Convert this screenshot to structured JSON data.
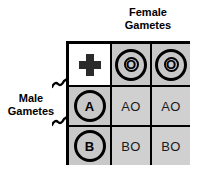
{
  "diagram": {
    "type": "punnett-square",
    "title_top": {
      "line1": "Female",
      "line2": "Gametes"
    },
    "title_left": {
      "line1": "Male",
      "line2": "Gametes"
    },
    "corner_icon": "cross-icon",
    "colors": {
      "grid_line": "#000000",
      "header_cell_fill": "#c8c8c8",
      "offspring_cell_fill": "#d0d0d0",
      "corner_cell_fill": "#ffffff",
      "text": "#000000",
      "background": "#ffffff"
    },
    "female_gametes": [
      {
        "id": "female-gamete-1",
        "label": "O"
      },
      {
        "id": "female-gamete-2",
        "label": "O"
      }
    ],
    "male_gametes": [
      {
        "id": "male-gamete-1",
        "label": "A"
      },
      {
        "id": "male-gamete-2",
        "label": "B"
      }
    ],
    "offspring": [
      {
        "id": "offspring-1-1",
        "label": "AO"
      },
      {
        "id": "offspring-1-2",
        "label": "AO"
      },
      {
        "id": "offspring-2-1",
        "label": "BO"
      },
      {
        "id": "offspring-2-2",
        "label": "BO"
      }
    ]
  }
}
